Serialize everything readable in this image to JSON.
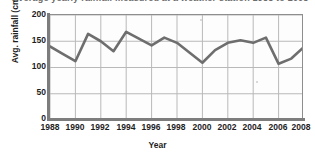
{
  "figure": {
    "title_partial": "Average yearly rainfall measured at a weather station 1988 to 2008",
    "background": "#ffffff",
    "line_color": "#6e6e6e",
    "grid_color": "#b9b9b9",
    "frame_color": "#8e8e8e",
    "axis_color": "#7d7d7d",
    "text_color": "#1d1d1d"
  },
  "chart_data": {
    "type": "line",
    "title": "Average yearly rainfall measured at a weather station 1988 to 2008",
    "xlabel": "Year",
    "ylabel": "Avg. rainfall (cm)",
    "grid": true,
    "legend": "none",
    "xlim": [
      1988,
      2008
    ],
    "ylim": [
      0,
      200
    ],
    "yticks": [
      0,
      50,
      100,
      150,
      200
    ],
    "xticks": [
      1988,
      1990,
      1992,
      1994,
      1996,
      1998,
      2000,
      2002,
      2004,
      2006,
      2008
    ],
    "x": [
      1988,
      1989,
      1990,
      1991,
      1992,
      1993,
      1994,
      1995,
      1996,
      1997,
      1998,
      1999,
      2000,
      2001,
      2002,
      2003,
      2004,
      2005,
      2006,
      2007,
      2008
    ],
    "series": [
      {
        "name": "Avg. rainfall",
        "values": [
          140,
          126,
          112,
          164,
          150,
          131,
          168,
          155,
          142,
          157,
          147,
          128,
          109,
          133,
          147,
          152,
          147,
          157,
          107,
          117,
          139
        ]
      }
    ],
    "units": "cm"
  },
  "axes": {
    "y_tick_labels": [
      "200",
      "150",
      "100",
      "50",
      "0"
    ],
    "x_tick_labels": [
      "1988",
      "1990",
      "1992",
      "1994",
      "1996",
      "1998",
      "2000",
      "2002",
      "2004",
      "2006",
      "2008"
    ],
    "y_axis_title": "Avg. rainfall (cm)",
    "x_axis_title": "Year"
  }
}
